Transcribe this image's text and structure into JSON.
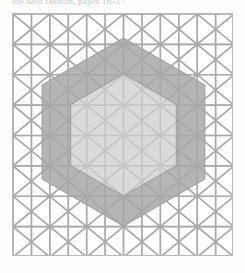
{
  "document": {
    "caption_top": "the hard fashion, pages 16–17",
    "caption_bottom": "",
    "page_background": "#fefefe"
  },
  "figure": {
    "name": "nested-hexagons-on-triangular-lattice",
    "frame": {
      "x": 12,
      "y": 13,
      "width": 221,
      "height": 243,
      "border_color": "#b9b9b9",
      "background": "#ffffff"
    },
    "colors": {
      "grid_line": "#a9a9a9",
      "outer_hexagon_fill": "#a8a8a8",
      "inner_hexagon_fill": "#dcdcdc",
      "hexagon_stroke": "#9b9b9b",
      "frame_border": "#b9b9b9",
      "page_background": "#fefefe"
    },
    "lattice": {
      "type": "triangular",
      "columns": 12,
      "rows": 8,
      "column_spacing": 18.42,
      "row_spacing": 30.375,
      "line_width": 1.6,
      "description": "isometric triangular grid of upward and downward pointing triangles"
    },
    "shapes": [
      {
        "name": "outer-hexagon",
        "type": "regular-hexagon",
        "orientation": "pointy-top",
        "center_x": 122.5,
        "center_y": 131,
        "radius": 94,
        "fill": "#a8a8a8",
        "opacity": 0.85,
        "vertices": [
          [
            122.5,
            37
          ],
          [
            203.9,
            84
          ],
          [
            203.9,
            178
          ],
          [
            122.5,
            225
          ],
          [
            41.1,
            178
          ],
          [
            41.1,
            84
          ]
        ]
      },
      {
        "name": "inner-hexagon",
        "type": "regular-hexagon",
        "orientation": "pointy-top",
        "center_x": 122.5,
        "center_y": 134,
        "radius": 61,
        "fill": "#dcdcdc",
        "opacity": 0.95,
        "vertices": [
          [
            122.5,
            73
          ],
          [
            175.3,
            103.5
          ],
          [
            175.3,
            164.5
          ],
          [
            122.5,
            195
          ],
          [
            69.7,
            164.5
          ],
          [
            69.7,
            103.5
          ]
        ]
      }
    ]
  }
}
